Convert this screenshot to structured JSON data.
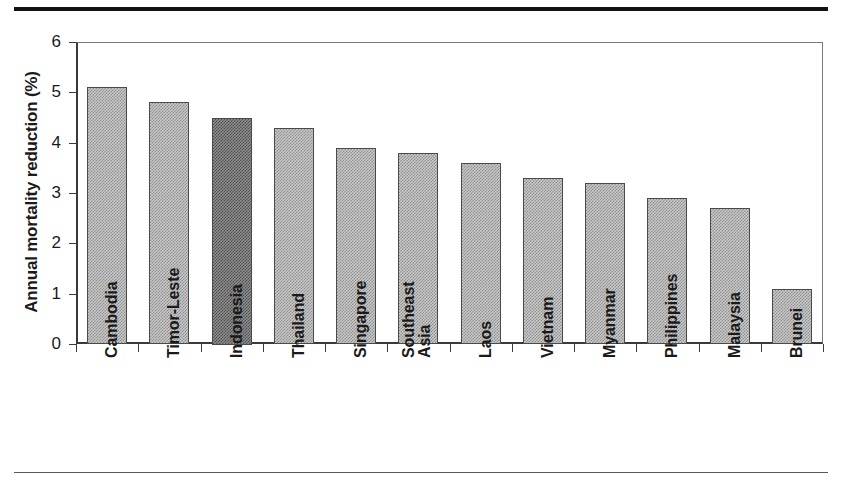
{
  "figure": {
    "rules": {
      "top_rule": "thick-horizontal-rule",
      "bottom_rule": "thin-horizontal-rule"
    }
  },
  "chart_data": {
    "type": "bar",
    "title": "",
    "xlabel": "",
    "ylabel": "Annual mortality reduction (%)",
    "ylim": [
      0,
      6
    ],
    "ytick_labels": [
      "0",
      "1",
      "2",
      "3",
      "4",
      "5",
      "6"
    ],
    "yticks": [
      0,
      1,
      2,
      3,
      4,
      5,
      6
    ],
    "grid": false,
    "legend": "none",
    "highlight_category": "Indonesia",
    "colors": {
      "bar_light": "#c9c9c9",
      "bar_dark": "#8d8d8d",
      "bar_outline": "#4a4a4a",
      "axis": "#3a3a3a",
      "text": "#1a1a1a"
    },
    "categories": [
      "Cambodia",
      "Timor-Leste",
      "Indonesia",
      "Thailand",
      "Singapore",
      "Southeast\nAsia",
      "Laos",
      "Vietnam",
      "Myanmar",
      "Philippines",
      "Malaysia",
      "Brunei"
    ],
    "values": [
      5.1,
      4.8,
      4.5,
      4.3,
      3.9,
      3.8,
      3.6,
      3.3,
      3.2,
      2.9,
      2.7,
      1.1
    ]
  }
}
